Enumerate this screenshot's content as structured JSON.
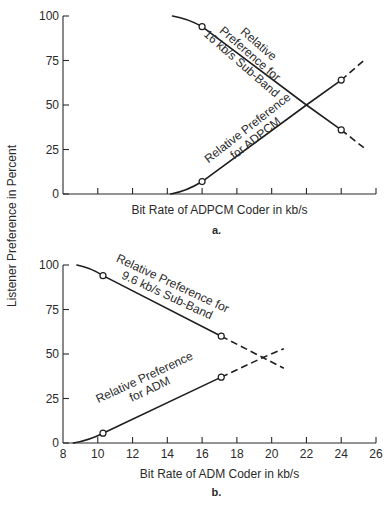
{
  "figure": {
    "ylabel": "Listener Preference in Percent",
    "background": "#ffffff",
    "ink": "#1e1e1e"
  },
  "chart_data": [
    {
      "type": "line",
      "panel": "a.",
      "xlabel": "Bit Rate of ADPCM Coder in kb/s",
      "ylabel": "Listener Preference in Percent",
      "xlim": [
        8,
        26
      ],
      "ylim": [
        0,
        100
      ],
      "yticks": [
        0,
        25,
        50,
        75,
        100
      ],
      "xticks": [
        8,
        10,
        12,
        14,
        16,
        18,
        20,
        22,
        24,
        26
      ],
      "xtick_labels_shown": false,
      "grid": false,
      "series": [
        {
          "name": "Relative Preference for 16 kb/s Sub-Band",
          "label_lines": [
            "Relative",
            "Preference for",
            "16 kb/s Sub-Band"
          ],
          "solid": [
            [
              14.3,
              100
            ],
            [
              15.2,
              98.5
            ],
            [
              16,
              94
            ],
            [
              22,
              50
            ],
            [
              24,
              36
            ]
          ],
          "dashed": [
            [
              24,
              36
            ],
            [
              25.3,
              26
            ]
          ],
          "markers": [
            [
              16,
              94
            ],
            [
              24,
              36
            ]
          ]
        },
        {
          "name": "Relative Preference for ADPCM",
          "label_lines": [
            "Relative Preference",
            "for ADPCM"
          ],
          "solid": [
            [
              14.2,
              0
            ],
            [
              15.1,
              1.5
            ],
            [
              16,
              7
            ],
            [
              22,
              50
            ],
            [
              24,
              64
            ]
          ],
          "dashed": [
            [
              24,
              64
            ],
            [
              25.3,
              75
            ]
          ],
          "markers": [
            [
              16,
              7
            ],
            [
              24,
              64
            ]
          ]
        }
      ],
      "annotations": [
        {
          "text": "crossover",
          "x": 22,
          "y": 50
        }
      ]
    },
    {
      "type": "line",
      "panel": "b.",
      "xlabel": "Bit Rate of ADM Coder in kb/s",
      "ylabel": "Listener Preference in Percent",
      "xlim": [
        8,
        26
      ],
      "ylim": [
        0,
        100
      ],
      "yticks": [
        0,
        25,
        50,
        75,
        100
      ],
      "xticks": [
        8,
        10,
        12,
        14,
        16,
        18,
        20,
        22,
        24,
        26
      ],
      "xtick_labels_shown": true,
      "grid": false,
      "series": [
        {
          "name": "Relative Preference for 9.6 kb/s Sub-Band",
          "label_lines": [
            "Relative Preference for",
            "9.6 kb/s Sub-Band"
          ],
          "solid": [
            [
              8.8,
              100
            ],
            [
              9.6,
              98.5
            ],
            [
              10.3,
              94
            ],
            [
              17.1,
              60
            ]
          ],
          "dashed": [
            [
              17.1,
              60
            ],
            [
              19.5,
              48
            ],
            [
              20.7,
              42
            ]
          ],
          "markers": [
            [
              10.3,
              94
            ],
            [
              17.1,
              60
            ]
          ]
        },
        {
          "name": "Relative Preference for ADM",
          "label_lines": [
            "Relative Preference",
            "for ADM"
          ],
          "solid": [
            [
              8.6,
              0
            ],
            [
              9.5,
              1.5
            ],
            [
              10.3,
              5.5
            ],
            [
              17.1,
              37
            ]
          ],
          "dashed": [
            [
              17.1,
              37
            ],
            [
              19.5,
              48
            ],
            [
              20.7,
              53
            ]
          ],
          "markers": [
            [
              10.3,
              5.5
            ],
            [
              17.1,
              37
            ]
          ]
        }
      ],
      "annotations": [
        {
          "text": "crossover",
          "x": 19.5,
          "y": 48
        }
      ]
    }
  ]
}
